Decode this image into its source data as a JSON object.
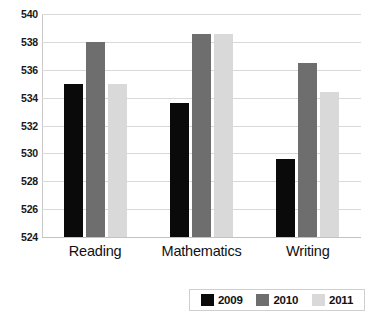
{
  "chart_data": {
    "type": "bar",
    "title": "",
    "subtitle": "",
    "xlabel": "",
    "ylabel": "",
    "categories": [
      "Reading",
      "Mathematics",
      "Writing"
    ],
    "series": [
      {
        "name": "2009",
        "color": "#0a0a0a",
        "values": [
          535.0,
          533.6,
          529.6
        ]
      },
      {
        "name": "2010",
        "color": "#6e6e6e",
        "values": [
          538.0,
          538.6,
          536.5
        ]
      },
      {
        "name": "2011",
        "color": "#d9d9d9",
        "values": [
          535.0,
          538.6,
          534.4
        ]
      }
    ],
    "ylim": [
      524,
      540
    ],
    "ytick_step": 2,
    "yticks": [
      540,
      538,
      536,
      534,
      532,
      530,
      528,
      526,
      524
    ],
    "ytick_labels": [
      "540",
      "538",
      "536",
      "534",
      "532",
      "530",
      "528",
      "526",
      "524"
    ],
    "grid": true,
    "grid_axis": "y",
    "legend": true,
    "legend_position": "bottom-right",
    "legend_entries": [
      "2009",
      "2010",
      "2011"
    ]
  }
}
